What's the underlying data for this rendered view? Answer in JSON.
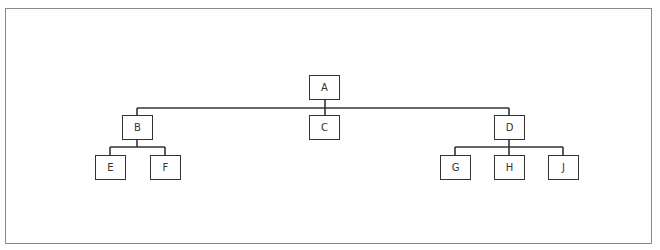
{
  "diagram": {
    "type": "org-chart",
    "line_color": "#333333",
    "frame_color": "#8a8a8a",
    "nodes": [
      {
        "id": "A",
        "label": "A",
        "x": 309,
        "y": 75
      },
      {
        "id": "B",
        "label": "B",
        "x": 122,
        "y": 115
      },
      {
        "id": "C",
        "label": "C",
        "x": 309,
        "y": 115
      },
      {
        "id": "D",
        "label": "D",
        "x": 494,
        "y": 115
      },
      {
        "id": "E",
        "label": "E",
        "x": 95,
        "y": 155
      },
      {
        "id": "F",
        "label": "F",
        "x": 150,
        "y": 155
      },
      {
        "id": "G",
        "label": "G",
        "x": 440,
        "y": 155
      },
      {
        "id": "H",
        "label": "H",
        "x": 494,
        "y": 155
      },
      {
        "id": "J",
        "label": "J",
        "x": 548,
        "y": 155
      }
    ],
    "edges": [
      [
        "A",
        "B"
      ],
      [
        "A",
        "C"
      ],
      [
        "A",
        "D"
      ],
      [
        "B",
        "E"
      ],
      [
        "B",
        "F"
      ],
      [
        "D",
        "G"
      ],
      [
        "D",
        "H"
      ],
      [
        "D",
        "J"
      ]
    ]
  }
}
